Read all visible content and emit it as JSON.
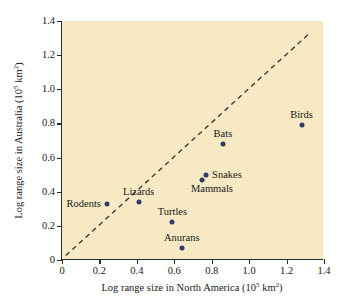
{
  "chart_data": {
    "type": "scatter",
    "title": "",
    "xlabel": "Log range size in North America (10⁵ km²)",
    "ylabel": "Log range size in Australia (10⁵ km²)",
    "xlim": [
      0,
      1.4
    ],
    "ylim": [
      0,
      1.4
    ],
    "xticks": [
      "0",
      "0.2",
      "0.4",
      "0.6",
      "0.8",
      "1.0",
      "1.2",
      "1.4"
    ],
    "xtick_values": [
      0,
      0.2,
      0.4,
      0.6,
      0.8,
      1.0,
      1.2,
      1.4
    ],
    "yticks": [
      "0",
      "0.2",
      "0.4",
      "0.6",
      "0.8",
      "1.0",
      "1.2",
      "1.4"
    ],
    "ytick_values": [
      0,
      0.2,
      0.4,
      0.6,
      0.8,
      1.0,
      1.2,
      1.4
    ],
    "grid": false,
    "legend": "none",
    "plot_background": "#f6e9c4",
    "point_color": "#2d3c68",
    "reference_line": {
      "style": "dashed",
      "color": "#3c3c3c",
      "description": "1:1 line",
      "x_start": 0.02,
      "y_start": 0.02,
      "x_end": 1.32,
      "y_end": 1.32
    },
    "points": [
      {
        "label": "Rodents",
        "x": 0.24,
        "y": 0.33,
        "label_pos": "left"
      },
      {
        "label": "Lizards",
        "x": 0.41,
        "y": 0.34,
        "label_pos": "above"
      },
      {
        "label": "Turtles",
        "x": 0.59,
        "y": 0.22,
        "label_pos": "above"
      },
      {
        "label": "Anurans",
        "x": 0.64,
        "y": 0.07,
        "label_pos": "above"
      },
      {
        "label": "Mammals",
        "x": 0.75,
        "y": 0.47,
        "label_pos": "below-right"
      },
      {
        "label": "Snakes",
        "x": 0.77,
        "y": 0.5,
        "label_pos": "right"
      },
      {
        "label": "Bats",
        "x": 0.86,
        "y": 0.68,
        "label_pos": "above"
      },
      {
        "label": "Birds",
        "x": 1.28,
        "y": 0.79,
        "label_pos": "above"
      }
    ]
  }
}
